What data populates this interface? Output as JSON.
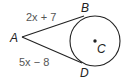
{
  "diagram": {
    "type": "circle with two tangent segments",
    "points": {
      "A": "A",
      "B": "B",
      "C": "C",
      "D": "D"
    },
    "segments": {
      "AB": "2x + 7",
      "AD": "5x − 8"
    },
    "circle": {
      "center": "C"
    },
    "colors": {
      "stroke": "#222222",
      "label": "#222222",
      "expression": "#555555"
    }
  }
}
